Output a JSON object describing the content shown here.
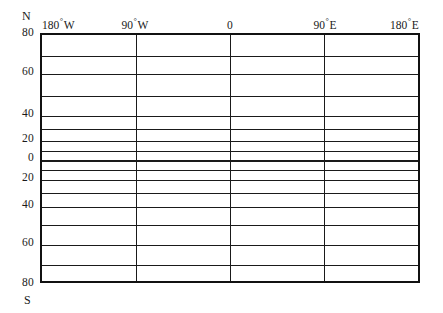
{
  "figure": {
    "type": "graticule-grid"
  },
  "poles": {
    "north_label": "N",
    "south_label": "S"
  },
  "longitude_axis": {
    "position": "top",
    "ticks": [
      {
        "label_value": "180",
        "hemisphere": "W",
        "value": -180,
        "x_pct": 0
      },
      {
        "label_value": "90",
        "hemisphere": "W",
        "value": -90,
        "x_pct": 25
      },
      {
        "label_value": "0",
        "hemisphere": "",
        "value": 0,
        "x_pct": 50
      },
      {
        "label_value": "90",
        "hemisphere": "E",
        "value": 90,
        "x_pct": 75
      },
      {
        "label_value": "180",
        "hemisphere": "E",
        "value": 180,
        "x_pct": 100
      }
    ]
  },
  "latitude_axis": {
    "position": "left",
    "labelled_ticks": [
      {
        "label": "80",
        "value": 80,
        "y_px": 33
      },
      {
        "label": "60",
        "value": 60,
        "y_px": 72
      },
      {
        "label": "40",
        "value": 40,
        "y_px": 114
      },
      {
        "label": "20",
        "value": 20,
        "y_px": 139
      },
      {
        "label": "0",
        "value": 0,
        "y_px": 158
      },
      {
        "label": "20",
        "value": -20,
        "y_px": 178
      },
      {
        "label": "40",
        "value": -40,
        "y_px": 205
      },
      {
        "label": "60",
        "value": -60,
        "y_px": 243
      },
      {
        "label": "80",
        "value": -80,
        "y_px": 283
      }
    ]
  },
  "chart_data": {
    "type": "line",
    "title": "",
    "subtitle": "",
    "xlabel": "",
    "ylabel": "",
    "grid": true,
    "legend": null,
    "xlim": [
      -180,
      180
    ],
    "ylim": [
      -80,
      80
    ],
    "x_ticks": [
      -180,
      -90,
      0,
      90,
      180
    ],
    "x_tick_labels": [
      "180 ° W",
      "90 ° W",
      "0",
      "90 ° E",
      "180 ° E"
    ],
    "y_ticks": [
      80,
      60,
      40,
      20,
      0,
      -20,
      -40,
      -60,
      -80
    ],
    "y_tick_labels": [
      "80",
      "60",
      "40",
      "20",
      "0",
      "20",
      "40",
      "60",
      "80"
    ],
    "series": [],
    "annotations": [
      "N",
      "S"
    ],
    "gridlines": {
      "latitude_deg": [
        80,
        70,
        60,
        50,
        40,
        30,
        20,
        10,
        0,
        -10,
        -20,
        -30,
        -40,
        -50,
        -60,
        -70,
        -80
      ],
      "latitude_y_px": [
        33,
        53.5,
        72,
        94,
        114,
        127,
        139,
        149,
        158,
        167.5,
        178,
        190.5,
        205,
        223,
        243,
        263,
        283
      ],
      "longitude_deg": [
        -180,
        -90,
        0,
        90,
        180
      ],
      "longitude_x_pct": [
        0,
        25,
        50,
        75,
        100
      ]
    }
  }
}
